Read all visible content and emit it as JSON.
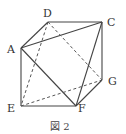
{
  "figure": {
    "caption": "図 2",
    "points": {
      "A": {
        "label": "A",
        "x": 21,
        "y": 48
      },
      "C": {
        "label": "C",
        "x": 102,
        "y": 22
      },
      "D": {
        "label": "D",
        "x": 48,
        "y": 22
      },
      "E": {
        "label": "E",
        "x": 21,
        "y": 106
      },
      "F": {
        "label": "F",
        "x": 76,
        "y": 106
      },
      "G": {
        "label": "G",
        "x": 102,
        "y": 80
      }
    },
    "solid_edges": [
      [
        "D",
        "C"
      ],
      [
        "D",
        "A"
      ],
      [
        "A",
        "C"
      ],
      [
        "A",
        "E"
      ],
      [
        "E",
        "F"
      ],
      [
        "A",
        "F"
      ],
      [
        "C",
        "G"
      ],
      [
        "C",
        "F"
      ],
      [
        "F",
        "G"
      ]
    ],
    "dashed_edges": [
      [
        "D",
        "E"
      ],
      [
        "D",
        "G"
      ],
      [
        "E",
        "G"
      ]
    ]
  }
}
